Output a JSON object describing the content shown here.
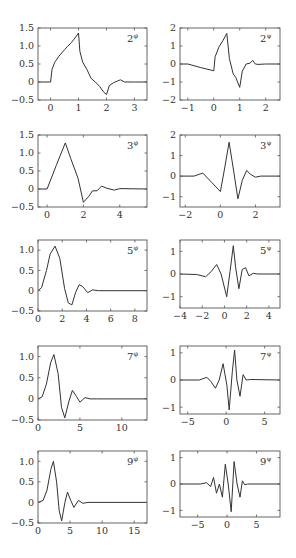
{
  "chart_data": [
    {
      "id": "phi2",
      "type": "line",
      "label": "2",
      "superscript": "φ",
      "xlim": [
        -0.45,
        3.45
      ],
      "ylim": [
        -0.5,
        1.5
      ],
      "xticks": [
        0,
        1,
        2,
        3
      ],
      "xtick_labels": [
        "0",
        "1",
        "2",
        "3"
      ],
      "yticks": [
        -0.5,
        0,
        0.5,
        1.0,
        1.5
      ],
      "ytick_labels": [
        "−0.5",
        "0",
        "0.5",
        "1.0",
        "1.5"
      ],
      "x": [
        -0.45,
        0,
        0.05,
        0.15,
        0.3,
        0.5,
        0.6,
        0.75,
        0.9,
        1.0,
        1.05,
        1.15,
        1.3,
        1.45,
        1.6,
        1.75,
        1.9,
        2.0,
        2.1,
        2.25,
        2.4,
        2.5,
        2.65,
        3.0,
        3.45
      ],
      "y": [
        0,
        0,
        0.35,
        0.55,
        0.72,
        0.9,
        0.98,
        1.1,
        1.25,
        1.36,
        0.85,
        0.55,
        0.35,
        0.1,
        0.0,
        -0.12,
        -0.28,
        -0.35,
        -0.1,
        -0.02,
        0.03,
        0.06,
        0.0,
        0.0,
        0.0
      ]
    },
    {
      "id": "psi2",
      "type": "line",
      "label": "2",
      "superscript": "ψ",
      "xlim": [
        -1.3,
        2.55
      ],
      "ylim": [
        -2,
        2
      ],
      "xticks": [
        -1,
        0,
        1,
        2
      ],
      "xtick_labels": [
        "−1",
        "0",
        "1",
        "2"
      ],
      "yticks": [
        -2,
        -1,
        0,
        1,
        2
      ],
      "ytick_labels": [
        "−2",
        "−1",
        "0",
        "1",
        "2"
      ],
      "x": [
        -1.3,
        -1.0,
        -0.5,
        0.0,
        0.05,
        0.2,
        0.35,
        0.5,
        0.6,
        0.75,
        0.85,
        1.0,
        1.1,
        1.25,
        1.4,
        1.5,
        1.6,
        1.7,
        2.0,
        2.55
      ],
      "y": [
        0,
        0,
        -0.2,
        -0.38,
        0.4,
        0.95,
        1.3,
        1.7,
        0.3,
        -0.55,
        -0.75,
        -1.3,
        -0.4,
        0.0,
        0.05,
        0.2,
        0.0,
        -0.02,
        0,
        0
      ]
    },
    {
      "id": "phi3",
      "type": "line",
      "label": "3",
      "superscript": "φ",
      "xlim": [
        -0.5,
        5.5
      ],
      "ylim": [
        -0.5,
        1.5
      ],
      "xticks": [
        0,
        2,
        4
      ],
      "xtick_labels": [
        "0",
        "2",
        "4"
      ],
      "yticks": [
        -0.5,
        0,
        0.5,
        1.0,
        1.5
      ],
      "ytick_labels": [
        "−0.5",
        "0",
        "0.5",
        "1.0",
        "1.5"
      ],
      "x": [
        -0.5,
        0,
        0.5,
        1.0,
        1.3,
        1.7,
        2.0,
        2.3,
        2.5,
        2.75,
        3.0,
        3.3,
        3.7,
        4.0,
        5.5
      ],
      "y": [
        0,
        0,
        0.65,
        1.28,
        0.85,
        0.3,
        -0.37,
        -0.2,
        -0.05,
        -0.05,
        0.08,
        0.02,
        -0.03,
        0.01,
        0
      ]
    },
    {
      "id": "psi3",
      "type": "line",
      "label": "3",
      "superscript": "ψ",
      "xlim": [
        -2.3,
        3.4
      ],
      "ylim": [
        -1.5,
        2
      ],
      "xticks": [
        -2,
        0,
        2
      ],
      "xtick_labels": [
        "−2",
        "0",
        "2"
      ],
      "yticks": [
        -1,
        0,
        1,
        2
      ],
      "ytick_labels": [
        "−1",
        "0",
        "1",
        "2"
      ],
      "x": [
        -2.3,
        -1.5,
        -1.0,
        -0.5,
        0.0,
        0.25,
        0.5,
        0.75,
        1.0,
        1.25,
        1.5,
        1.7,
        2.0,
        2.3,
        3.4
      ],
      "y": [
        0,
        0,
        0.15,
        -0.3,
        -0.75,
        0.4,
        1.65,
        0.3,
        -1.1,
        -0.2,
        0.28,
        0.1,
        -0.05,
        0,
        0
      ]
    },
    {
      "id": "phi5",
      "type": "line",
      "label": "5",
      "superscript": "φ",
      "xlim": [
        0,
        9
      ],
      "ylim": [
        -0.5,
        1.25
      ],
      "xticks": [
        0,
        2,
        4,
        6,
        8
      ],
      "xtick_labels": [
        "0",
        "2",
        "4",
        "6",
        "8"
      ],
      "yticks": [
        -0.5,
        0,
        0.5,
        1.0
      ],
      "ytick_labels": [
        "−0.5",
        "0",
        "0.5",
        "1.0"
      ],
      "x": [
        0,
        0.3,
        0.7,
        1.0,
        1.4,
        1.8,
        2.2,
        2.5,
        2.8,
        3.1,
        3.4,
        3.7,
        4.1,
        4.5,
        5.0,
        9
      ],
      "y": [
        0,
        0.08,
        0.5,
        0.9,
        1.1,
        0.8,
        0.05,
        -0.3,
        -0.35,
        -0.05,
        0.15,
        0.1,
        -0.05,
        0.02,
        0,
        0
      ]
    },
    {
      "id": "psi5",
      "type": "line",
      "label": "5",
      "superscript": "ψ",
      "xlim": [
        -4,
        5
      ],
      "ylim": [
        -1.5,
        1.5
      ],
      "xticks": [
        -4,
        -2,
        0,
        2,
        4
      ],
      "xtick_labels": [
        "−4",
        "−2",
        "0",
        "2",
        "4"
      ],
      "yticks": [
        -1,
        0,
        1
      ],
      "ytick_labels": [
        "−1",
        "0",
        "1"
      ],
      "x": [
        -4,
        -2.5,
        -1.7,
        -1.2,
        -0.7,
        -0.3,
        0.2,
        0.5,
        0.8,
        1.0,
        1.3,
        1.6,
        1.9,
        2.2,
        2.6,
        3.0,
        5
      ],
      "y": [
        0,
        -0.02,
        -0.12,
        0.1,
        0.42,
        0.0,
        -1.0,
        0.1,
        1.25,
        0.3,
        -0.65,
        0.2,
        0.28,
        -0.08,
        0.03,
        0,
        0
      ]
    },
    {
      "id": "phi7",
      "type": "line",
      "label": "7",
      "superscript": "φ",
      "xlim": [
        0,
        13
      ],
      "ylim": [
        -0.5,
        1.25
      ],
      "xticks": [
        0,
        5,
        10
      ],
      "xtick_labels": [
        "0",
        "5",
        "10"
      ],
      "yticks": [
        -0.5,
        0,
        0.5,
        1.0
      ],
      "ytick_labels": [
        "−0.5",
        "0",
        "0.5",
        "1.0"
      ],
      "x": [
        0,
        0.5,
        1.0,
        1.5,
        1.9,
        2.4,
        2.8,
        3.2,
        3.7,
        4.1,
        4.6,
        5.0,
        5.6,
        6.2,
        7.0,
        13
      ],
      "y": [
        0,
        0.05,
        0.35,
        0.85,
        1.05,
        0.6,
        -0.2,
        -0.45,
        -0.05,
        0.2,
        0.05,
        -0.08,
        0.03,
        0.0,
        0,
        0
      ]
    },
    {
      "id": "psi7",
      "type": "line",
      "label": "7",
      "superscript": "ψ",
      "xlim": [
        -6,
        7
      ],
      "ylim": [
        -1.25,
        1.25
      ],
      "xticks": [
        -5,
        0,
        5
      ],
      "xtick_labels": [
        "−5",
        "0",
        "5"
      ],
      "yticks": [
        -1,
        0,
        1
      ],
      "ytick_labels": [
        "−1",
        "0",
        "1"
      ],
      "x": [
        -6,
        -3.5,
        -2.5,
        -2.0,
        -1.4,
        -0.9,
        -0.4,
        0.1,
        0.4,
        0.8,
        1.1,
        1.4,
        1.8,
        2.2,
        2.6,
        3.2,
        7
      ],
      "y": [
        0,
        0,
        0.1,
        -0.05,
        -0.3,
        0.0,
        0.6,
        -0.2,
        -1.1,
        0.3,
        1.1,
        0.0,
        -0.6,
        0.2,
        0.0,
        0.02,
        0
      ]
    },
    {
      "id": "phi9",
      "type": "line",
      "label": "9",
      "superscript": "φ",
      "xlim": [
        0,
        17
      ],
      "ylim": [
        -0.5,
        1.25
      ],
      "xticks": [
        0,
        5,
        10,
        15
      ],
      "xtick_labels": [
        "0",
        "5",
        "10",
        "15"
      ],
      "yticks": [
        -0.5,
        0,
        0.5,
        1.0
      ],
      "ytick_labels": [
        "−0.5",
        "0",
        "0.5",
        "1.0"
      ],
      "x": [
        0,
        0.8,
        1.4,
        2.0,
        2.4,
        2.9,
        3.3,
        3.7,
        4.2,
        4.6,
        5.1,
        5.6,
        6.3,
        7.0,
        7.8,
        17
      ],
      "y": [
        0,
        0.05,
        0.3,
        0.8,
        1.0,
        0.5,
        -0.2,
        -0.45,
        0.0,
        0.25,
        0.05,
        -0.12,
        0.05,
        -0.02,
        0,
        0
      ]
    },
    {
      "id": "psi9",
      "type": "line",
      "label": "9",
      "superscript": "ψ",
      "xlim": [
        -8,
        9
      ],
      "ylim": [
        -1.25,
        1.25
      ],
      "xticks": [
        -5,
        0,
        5
      ],
      "xtick_labels": [
        "−5",
        "0",
        "5"
      ],
      "yticks": [
        -1,
        0,
        1
      ],
      "ytick_labels": [
        "−1",
        "0",
        "1"
      ],
      "x": [
        -8,
        -4.5,
        -3.5,
        -2.8,
        -2.3,
        -1.8,
        -1.3,
        -0.8,
        -0.3,
        0.2,
        0.7,
        1.2,
        1.7,
        2.2,
        2.6,
        3.0,
        3.5,
        9
      ],
      "y": [
        0,
        0,
        0.05,
        -0.1,
        0.25,
        -0.35,
        0.0,
        -0.5,
        0.75,
        0.0,
        -1.05,
        0.85,
        0.0,
        -0.5,
        0.12,
        -0.03,
        0,
        0
      ]
    }
  ],
  "layout": {
    "rows": 5,
    "cols": 2,
    "frames": [
      {
        "left": 38,
        "top": 28,
        "width": 109,
        "height": 72
      },
      {
        "left": 180,
        "top": 28,
        "width": 100,
        "height": 72
      },
      {
        "left": 38,
        "top": 135,
        "width": 109,
        "height": 72
      },
      {
        "left": 180,
        "top": 135,
        "width": 100,
        "height": 72
      },
      {
        "left": 38,
        "top": 240,
        "width": 109,
        "height": 71
      },
      {
        "left": 180,
        "top": 240,
        "width": 100,
        "height": 68
      },
      {
        "left": 38,
        "top": 346,
        "width": 109,
        "height": 74
      },
      {
        "left": 180,
        "top": 346,
        "width": 100,
        "height": 68
      },
      {
        "left": 38,
        "top": 451,
        "width": 109,
        "height": 72
      },
      {
        "left": 180,
        "top": 451,
        "width": 100,
        "height": 66
      }
    ]
  }
}
